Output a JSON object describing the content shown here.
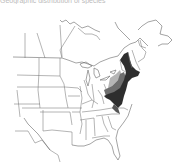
{
  "caption": "Geographic distribution of species",
  "map": {
    "region": "Eastern / Central United States and southern Canada",
    "legend_shades": [
      {
        "name": "dark",
        "color": "#2e2e2e"
      },
      {
        "name": "medium",
        "color": "#6e6e6e"
      },
      {
        "name": "light",
        "color": "#b5b5b5"
      }
    ],
    "highlighted_area": "Northeastern US (New England, New York, Pennsylvania, New Jersey, Mid-Atlantic)"
  }
}
